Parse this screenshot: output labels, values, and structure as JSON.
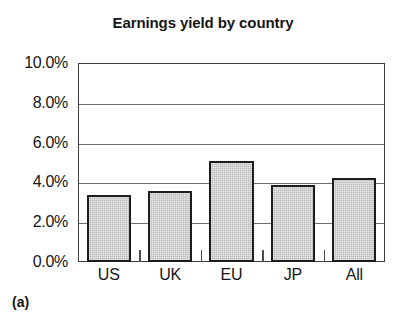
{
  "figure": {
    "caption": "(a)"
  },
  "chart_data": {
    "type": "bar",
    "title": "Earnings yield by country",
    "xlabel": "",
    "ylabel": "",
    "categories": [
      "US",
      "UK",
      "EU",
      "JP",
      "All"
    ],
    "values": [
      3.35,
      3.55,
      5.1,
      3.85,
      4.2
    ],
    "value_unit": "%",
    "ylim": [
      0,
      10
    ],
    "ytick_values": [
      0,
      2,
      4,
      6,
      8,
      10
    ],
    "ytick_labels": [
      "0.0%",
      "2.0%",
      "4.0%",
      "6.0%",
      "8.0%",
      "10.0%"
    ],
    "grid": true,
    "grid_axis": "y",
    "legend": false,
    "bar_fill_color": "#c9c9c9",
    "bar_edge_color": "#1d1d1d",
    "axis_color": "#3c3c3c",
    "background_color": "#ffffff"
  }
}
